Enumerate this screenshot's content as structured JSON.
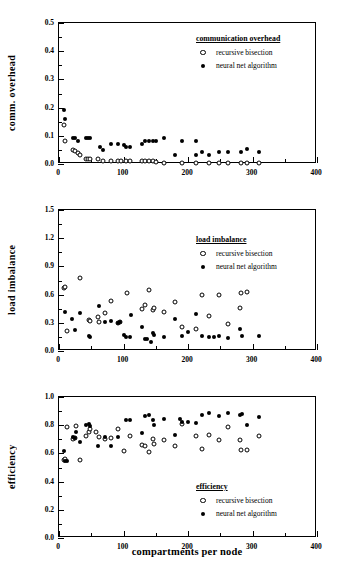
{
  "figure": {
    "xlabel": "compartments per node",
    "legend_series": [
      {
        "key": "recursive_bisection",
        "label": "recursive bisection",
        "marker": "open-circle"
      },
      {
        "key": "neural_net",
        "label": "neural net algorithm",
        "marker": "filled-circle"
      }
    ]
  },
  "chart_data": [
    {
      "type": "scatter",
      "title": "communication overhead",
      "xlabel": "",
      "ylabel": "comm. overhead",
      "xlim": [
        0,
        400
      ],
      "ylim": [
        0,
        0.5
      ],
      "xticks": [
        0,
        100,
        200,
        300,
        400
      ],
      "yticks": [
        0.0,
        0.1,
        0.2,
        0.3,
        0.4,
        0.5
      ],
      "xtick_labels": [
        "0",
        "100",
        "200",
        "300",
        "400"
      ],
      "ytick_labels": [
        "0.0",
        "0.1",
        "0.2",
        "0.3",
        "0.4",
        "0.5"
      ],
      "grid": false,
      "legend_position": "upper-right",
      "series": [
        {
          "name": "recursive bisection",
          "marker": "open-circle",
          "points": [
            [
              8,
              0.139
            ],
            [
              10,
              0.082
            ],
            [
              22,
              0.051
            ],
            [
              25,
              0.047
            ],
            [
              30,
              0.04
            ],
            [
              33,
              0.033
            ],
            [
              42,
              0.019
            ],
            [
              45,
              0.019
            ],
            [
              48,
              0.018
            ],
            [
              60,
              0.018
            ],
            [
              68,
              0.011
            ],
            [
              80,
              0.011
            ],
            [
              92,
              0.011
            ],
            [
              96,
              0.011
            ],
            [
              104,
              0.011
            ],
            [
              110,
              0.011
            ],
            [
              128,
              0.011
            ],
            [
              133,
              0.011
            ],
            [
              140,
              0.012
            ],
            [
              145,
              0.012
            ],
            [
              150,
              0.008
            ],
            [
              163,
              0.004
            ],
            [
              190,
              0.003
            ],
            [
              212,
              0.003
            ],
            [
              233,
              0.003
            ],
            [
              248,
              0.003
            ],
            [
              262,
              0.003
            ],
            [
              282,
              0.004
            ],
            [
              291,
              0.004
            ],
            [
              310,
              0.005
            ]
          ]
        },
        {
          "name": "neural net algorithm",
          "marker": "filled-circle",
          "points": [
            [
              8,
              0.19
            ],
            [
              10,
              0.161
            ],
            [
              22,
              0.092
            ],
            [
              25,
              0.091
            ],
            [
              30,
              0.08
            ],
            [
              42,
              0.091
            ],
            [
              45,
              0.091
            ],
            [
              48,
              0.091
            ],
            [
              63,
              0.06
            ],
            [
              68,
              0.05
            ],
            [
              80,
              0.071
            ],
            [
              92,
              0.071
            ],
            [
              100,
              0.068
            ],
            [
              104,
              0.06
            ],
            [
              110,
              0.06
            ],
            [
              128,
              0.072
            ],
            [
              133,
              0.082
            ],
            [
              140,
              0.082
            ],
            [
              145,
              0.082
            ],
            [
              150,
              0.082
            ],
            [
              163,
              0.092
            ],
            [
              180,
              0.032
            ],
            [
              190,
              0.082
            ],
            [
              212,
              0.082
            ],
            [
              212,
              0.031
            ],
            [
              222,
              0.043
            ],
            [
              233,
              0.032
            ],
            [
              248,
              0.043
            ],
            [
              262,
              0.043
            ],
            [
              282,
              0.044
            ],
            [
              291,
              0.053
            ],
            [
              310,
              0.043
            ]
          ]
        }
      ]
    },
    {
      "type": "scatter",
      "title": "load imbalance",
      "xlabel": "",
      "ylabel": "load  imbalance",
      "xlim": [
        0,
        400
      ],
      "ylim": [
        0,
        1.5
      ],
      "xticks": [
        0,
        100,
        200,
        300,
        400
      ],
      "yticks": [
        0.0,
        0.3,
        0.6,
        0.9,
        1.2,
        1.5
      ],
      "xtick_labels": [
        "0",
        "100",
        "200",
        "300",
        "400"
      ],
      "ytick_labels": [
        "0.0",
        "0.3",
        "0.6",
        "0.9",
        "1.2",
        "1.5"
      ],
      "grid": false,
      "legend_position": "upper-right",
      "series": [
        {
          "name": "recursive bisection",
          "marker": "open-circle",
          "points": [
            [
              8,
              0.67
            ],
            [
              10,
              0.68
            ],
            [
              13,
              0.21
            ],
            [
              33,
              0.78
            ],
            [
              46,
              0.33
            ],
            [
              48,
              0.32
            ],
            [
              60,
              0.365
            ],
            [
              62,
              0.31
            ],
            [
              72,
              0.4
            ],
            [
              80,
              0.53
            ],
            [
              92,
              0.3
            ],
            [
              94,
              0.31
            ],
            [
              105,
              0.62
            ],
            [
              128,
              0.45
            ],
            [
              133,
              0.49
            ],
            [
              140,
              0.65
            ],
            [
              145,
              0.44
            ],
            [
              148,
              0.46
            ],
            [
              163,
              0.41
            ],
            [
              180,
              0.52
            ],
            [
              190,
              0.26
            ],
            [
              212,
              0.23
            ],
            [
              222,
              0.595
            ],
            [
              233,
              0.37
            ],
            [
              248,
              0.6
            ],
            [
              262,
              0.29
            ],
            [
              281,
              0.46
            ],
            [
              282,
              0.62
            ],
            [
              291,
              0.63
            ]
          ]
        },
        {
          "name": "neural net algorithm",
          "marker": "filled-circle",
          "points": [
            [
              10,
              0.42
            ],
            [
              20,
              0.345
            ],
            [
              25,
              0.22
            ],
            [
              33,
              0.4
            ],
            [
              46,
              0.155
            ],
            [
              48,
              0.15
            ],
            [
              62,
              0.475
            ],
            [
              72,
              0.31
            ],
            [
              80,
              0.32
            ],
            [
              92,
              0.3
            ],
            [
              94,
              0.31
            ],
            [
              100,
              0.175
            ],
            [
              104,
              0.15
            ],
            [
              110,
              0.15
            ],
            [
              111,
              0.385
            ],
            [
              128,
              0.26
            ],
            [
              133,
              0.13
            ],
            [
              136,
              0.125
            ],
            [
              142,
              0.1
            ],
            [
              145,
              0.19
            ],
            [
              148,
              0.17
            ],
            [
              163,
              0.145
            ],
            [
              180,
              0.345
            ],
            [
              190,
              0.155
            ],
            [
              200,
              0.2
            ],
            [
              212,
              0.39
            ],
            [
              222,
              0.155
            ],
            [
              233,
              0.15
            ],
            [
              240,
              0.15
            ],
            [
              248,
              0.155
            ],
            [
              262,
              0.14
            ],
            [
              281,
              0.23
            ],
            [
              284,
              0.155
            ],
            [
              310,
              0.155
            ]
          ]
        }
      ]
    },
    {
      "type": "scatter",
      "title": "efficiency",
      "xlabel": "compartments per node",
      "ylabel": "efficiency",
      "xlim": [
        0,
        400
      ],
      "ylim": [
        0,
        1.0
      ],
      "xticks": [
        0,
        100,
        200,
        300,
        400
      ],
      "yticks": [
        0.0,
        0.2,
        0.4,
        0.6,
        0.8,
        1.0
      ],
      "xtick_labels": [
        "0",
        "100",
        "200",
        "300",
        "400"
      ],
      "ytick_labels": [
        "0.0",
        "0.2",
        "0.4",
        "0.6",
        "0.8",
        "1.0"
      ],
      "grid": false,
      "legend_position": "lower-right",
      "series": [
        {
          "name": "recursive bisection",
          "marker": "open-circle",
          "points": [
            [
              8,
              0.555
            ],
            [
              10,
              0.56
            ],
            [
              13,
              0.785
            ],
            [
              22,
              0.705
            ],
            [
              25,
              0.71
            ],
            [
              27,
              0.795
            ],
            [
              33,
              0.55
            ],
            [
              42,
              0.725
            ],
            [
              46,
              0.755
            ],
            [
              48,
              0.77
            ],
            [
              58,
              0.75
            ],
            [
              62,
              0.715
            ],
            [
              72,
              0.705
            ],
            [
              80,
              0.71
            ],
            [
              92,
              0.775
            ],
            [
              100,
              0.62
            ],
            [
              110,
              0.72
            ],
            [
              128,
              0.66
            ],
            [
              133,
              0.655
            ],
            [
              140,
              0.61
            ],
            [
              145,
              0.7
            ],
            [
              148,
              0.67
            ],
            [
              163,
              0.695
            ],
            [
              180,
              0.65
            ],
            [
              190,
              0.81
            ],
            [
              212,
              0.72
            ],
            [
              222,
              0.63
            ],
            [
              233,
              0.73
            ],
            [
              248,
              0.695
            ],
            [
              262,
              0.79
            ],
            [
              281,
              0.695
            ],
            [
              282,
              0.625
            ],
            [
              291,
              0.625
            ],
            [
              310,
              0.72
            ]
          ]
        },
        {
          "name": "neural net algorithm",
          "marker": "filled-circle",
          "points": [
            [
              8,
              0.62
            ],
            [
              10,
              0.545
            ],
            [
              13,
              0.545
            ],
            [
              22,
              0.715
            ],
            [
              25,
              0.71
            ],
            [
              27,
              0.755
            ],
            [
              33,
              0.68
            ],
            [
              42,
              0.8
            ],
            [
              46,
              0.805
            ],
            [
              48,
              0.795
            ],
            [
              60,
              0.65
            ],
            [
              72,
              0.715
            ],
            [
              80,
              0.65
            ],
            [
              92,
              0.715
            ],
            [
              104,
              0.835
            ],
            [
              110,
              0.835
            ],
            [
              128,
              0.745
            ],
            [
              133,
              0.865
            ],
            [
              140,
              0.87
            ],
            [
              145,
              0.835
            ],
            [
              148,
              0.8
            ],
            [
              163,
              0.845
            ],
            [
              180,
              0.73
            ],
            [
              188,
              0.845
            ],
            [
              190,
              0.825
            ],
            [
              200,
              0.82
            ],
            [
              212,
              0.815
            ],
            [
              222,
              0.875
            ],
            [
              233,
              0.885
            ],
            [
              248,
              0.865
            ],
            [
              262,
              0.885
            ],
            [
              281,
              0.87
            ],
            [
              284,
              0.88
            ],
            [
              291,
              0.8
            ],
            [
              310,
              0.86
            ]
          ]
        }
      ]
    }
  ]
}
